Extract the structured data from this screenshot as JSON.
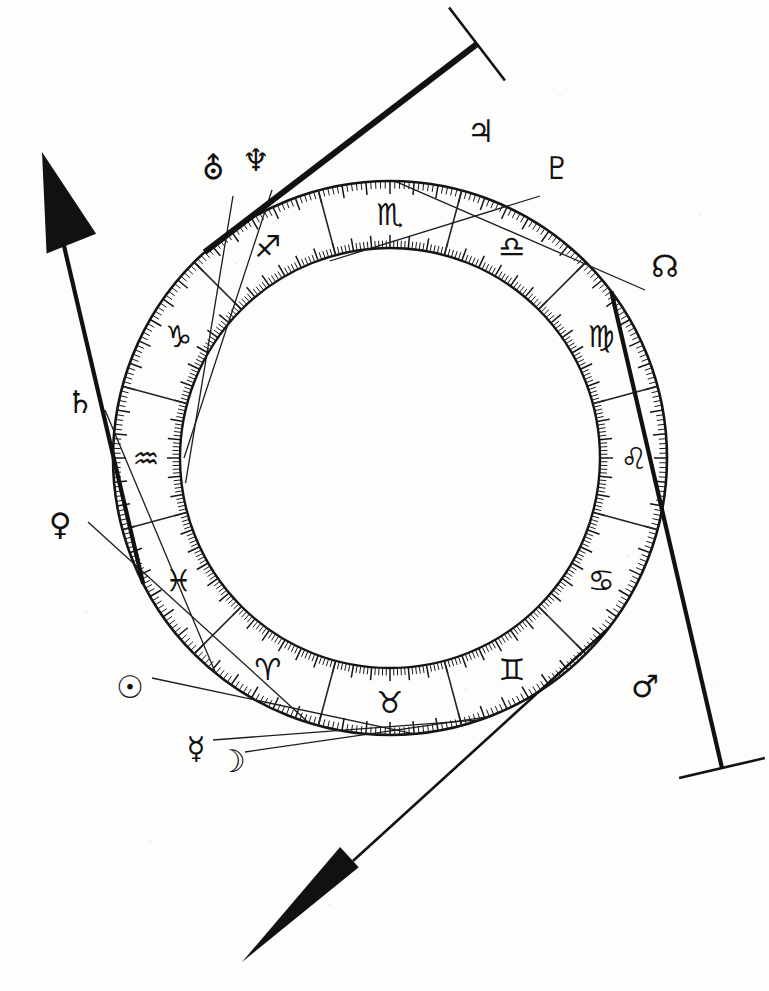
{
  "geometry": {
    "center_x": 390,
    "center_y": 458,
    "ring_outer_radius": 277,
    "ring_inner_radius": 210,
    "tick_outer_len": 13,
    "tick_inner_len": 13,
    "sign_label_radius": 244,
    "zero_offset_deg": 195,
    "direction": "clockwise"
  },
  "colors": {
    "ink": "#111111",
    "paper": "#fdfdfc",
    "tick": "#191919",
    "divider": "#232323"
  },
  "chart_data": {
    "type": "wheel",
    "subtitle": "Zodiac ring with degree scale, sign divisions, planetary pointers and four angles",
    "ring": {
      "ticks_per_sign": 30,
      "major_tick_every": 5,
      "ticks_on_outer_edge": true,
      "ticks_on_inner_edge": true,
      "sign_divider_lines": 12
    },
    "signs": [
      {
        "name": "Capricorn",
        "glyph": "♑",
        "index": 0,
        "start_deg": 0,
        "label_deg": 15
      },
      {
        "name": "Sagittarius",
        "glyph": "♐",
        "index": 1,
        "start_deg": 30,
        "label_deg": 45
      },
      {
        "name": "Scorpio",
        "glyph": "♏",
        "index": 2,
        "start_deg": 60,
        "label_deg": 75
      },
      {
        "name": "Libra",
        "glyph": "♎",
        "index": 3,
        "start_deg": 90,
        "label_deg": 105
      },
      {
        "name": "Virgo",
        "glyph": "♍",
        "index": 4,
        "start_deg": 120,
        "label_deg": 135
      },
      {
        "name": "Leo",
        "glyph": "♌",
        "index": 5,
        "start_deg": 150,
        "label_deg": 165
      },
      {
        "name": "Cancer",
        "glyph": "♋",
        "index": 6,
        "start_deg": 180,
        "label_deg": 195
      },
      {
        "name": "Gemini",
        "glyph": "♊",
        "index": 7,
        "start_deg": 210,
        "label_deg": 225
      },
      {
        "name": "Taurus",
        "glyph": "♉",
        "index": 8,
        "start_deg": 240,
        "label_deg": 255
      },
      {
        "name": "Aries",
        "glyph": "♈",
        "index": 9,
        "start_deg": 270,
        "label_deg": 285
      },
      {
        "name": "Pisces",
        "glyph": "♓",
        "index": 10,
        "start_deg": 300,
        "label_deg": 315
      },
      {
        "name": "Aquarius",
        "glyph": "♒",
        "index": 11,
        "start_deg": 330,
        "label_deg": 345
      }
    ],
    "planets": [
      {
        "name": "Uranus",
        "glyph": "⛢",
        "label_x": 213,
        "label_y": 168,
        "pointer_deg": 338,
        "pointer_crosses_ring": true,
        "pointer_end_x": 233,
        "pointer_end_y": 196
      },
      {
        "name": "Neptune",
        "glyph": "♆",
        "label_x": 256,
        "label_y": 160,
        "pointer_deg": 345,
        "pointer_crosses_ring": true,
        "pointer_end_x": 272,
        "pointer_end_y": 190
      },
      {
        "name": "Jupiter",
        "glyph": "♃",
        "label_x": 481,
        "label_y": 131,
        "pointer_deg": 33,
        "pointer_crosses_ring": false,
        "pointer_end_x": 0,
        "pointer_end_y": 0
      },
      {
        "name": "Pluto",
        "glyph": "♇",
        "label_x": 557,
        "label_y": 168,
        "pointer_deg": 58,
        "pointer_crosses_ring": true,
        "pointer_end_x": 540,
        "pointer_end_y": 196
      },
      {
        "name": "North Node",
        "glyph": "☊",
        "label_x": 665,
        "label_y": 266,
        "pointer_deg": 76,
        "pointer_crosses_ring": false,
        "pointer_end_x": 645,
        "pointer_end_y": 290
      },
      {
        "name": "Mars",
        "glyph": "♂",
        "label_x": 645,
        "label_y": 686,
        "pointer_deg": 128,
        "pointer_crosses_ring": false,
        "pointer_end_x": 0,
        "pointer_end_y": 0
      },
      {
        "name": "Saturn",
        "glyph": "♄",
        "label_x": 80,
        "label_y": 402,
        "pointer_deg": 294,
        "pointer_crosses_ring": false,
        "pointer_end_x": 105,
        "pointer_end_y": 410
      },
      {
        "name": "Venus",
        "glyph": "♀",
        "label_x": 60,
        "label_y": 524,
        "pointer_deg": 272,
        "pointer_crosses_ring": false,
        "pointer_end_x": 88,
        "pointer_end_y": 522
      },
      {
        "name": "Sun",
        "glyph": "☉",
        "label_x": 130,
        "label_y": 687,
        "pointer_deg": 250,
        "pointer_crosses_ring": false,
        "pointer_end_x": 152,
        "pointer_end_y": 678
      },
      {
        "name": "Mercury",
        "glyph": "☿",
        "label_x": 196,
        "label_y": 748,
        "pointer_deg": 236,
        "pointer_crosses_ring": false,
        "pointer_end_x": 213,
        "pointer_end_y": 740
      },
      {
        "name": "Moon",
        "glyph": "☽",
        "label_x": 232,
        "label_y": 761,
        "pointer_deg": 234,
        "pointer_crosses_ring": false,
        "pointer_end_x": 245,
        "pointer_end_y": 752
      }
    ],
    "axes": [
      {
        "name": "Ascendant",
        "short": "ASC",
        "style": "arrow-large",
        "tip_x": 42,
        "tip_y": 152,
        "ring_deg": 318,
        "description": "heavy line to large solid arrowhead, upper left"
      },
      {
        "name": "Imum Coeli",
        "short": "IC",
        "style": "arrow-narrow",
        "tip_x": 242,
        "tip_y": 962,
        "ring_deg": 203,
        "description": "line to long narrow solid arrowhead, lower left"
      },
      {
        "name": "Midheaven",
        "short": "MC",
        "style": "t-bar",
        "tip_x": 477,
        "tip_y": 44,
        "ring_deg": 33,
        "description": "heavy line ending in crossbar, carries Jupiter glyph"
      },
      {
        "name": "Descendant",
        "short": "DSC",
        "style": "t-bar",
        "tip_x": 722,
        "tip_y": 768,
        "ring_deg": 128,
        "description": "line ending in crossbar, carries Mars glyph"
      }
    ]
  }
}
